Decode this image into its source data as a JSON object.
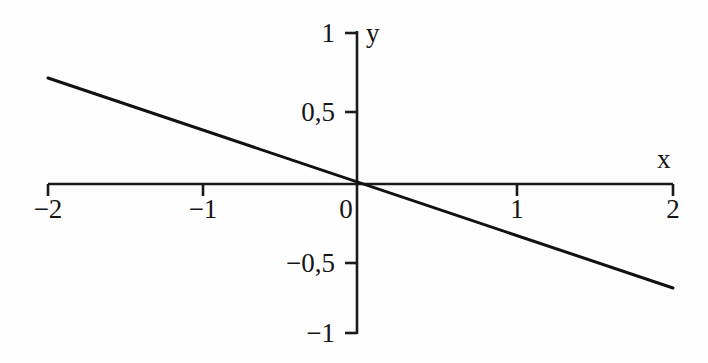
{
  "figure": {
    "background_color": "#fefefe",
    "line_color": "#111111",
    "axis_color": "#1a1a1a",
    "text_color": "#151515"
  },
  "axes": {
    "x_axis_label": "x",
    "y_axis_label": "y",
    "x_ticks": [
      {
        "value": -2,
        "label": "−2",
        "px": 48
      },
      {
        "value": -1,
        "label": "−1",
        "px": 203
      },
      {
        "value": 0,
        "label": "0",
        "px": 357
      },
      {
        "value": 1,
        "label": "1",
        "px": 517
      },
      {
        "value": 2,
        "label": "2",
        "px": 673
      }
    ],
    "y_ticks": [
      {
        "value": 1,
        "label": "1",
        "px": 33
      },
      {
        "value": 0.5,
        "label": "0,5",
        "px": 112
      },
      {
        "value": -0.5,
        "label": "−0,5",
        "px": 263
      },
      {
        "value": -1,
        "label": "−1",
        "px": 333
      }
    ]
  },
  "chart_data": {
    "type": "line",
    "title": "",
    "subtitle": "",
    "xlabel": "x",
    "ylabel": "y",
    "xlim": [
      -2,
      2
    ],
    "ylim": [
      -1,
      1
    ],
    "xticks": [
      -2,
      -1,
      0,
      1,
      2
    ],
    "xticklabels": [
      "−2",
      "−1",
      "0",
      "1",
      "2"
    ],
    "yticks": [
      -1,
      -0.5,
      0.5,
      1
    ],
    "yticklabels": [
      "−1",
      "−0,5",
      "0,5",
      "1"
    ],
    "grid": false,
    "legend": false,
    "decimal_separator": ",",
    "annotations": [],
    "series": [
      {
        "name": "y = -0,35x",
        "equation": "y = -0,35·x",
        "slope": -0.35,
        "intercept": 0,
        "color": "#111111",
        "linewidth": 3,
        "x": [
          -2,
          -1.5,
          -1,
          -0.5,
          0,
          0.5,
          1,
          1.5,
          2
        ],
        "values": [
          0.7,
          0.525,
          0.35,
          0.175,
          0,
          -0.175,
          -0.35,
          -0.525,
          -0.7
        ]
      }
    ]
  }
}
